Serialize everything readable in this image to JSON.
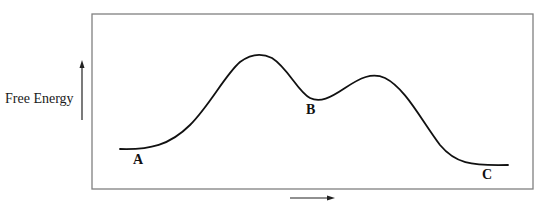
{
  "diagram": {
    "type": "energy-profile",
    "y_axis_label": "Free Energy",
    "x_axis_label": "",
    "points": [
      {
        "label": "A",
        "role": "start"
      },
      {
        "label": "B",
        "role": "intermediate"
      },
      {
        "label": "C",
        "role": "end"
      }
    ],
    "colors": {
      "curve": "#111111",
      "frame": "#777777",
      "arrow": "#222222",
      "background": "#ffffff"
    }
  }
}
